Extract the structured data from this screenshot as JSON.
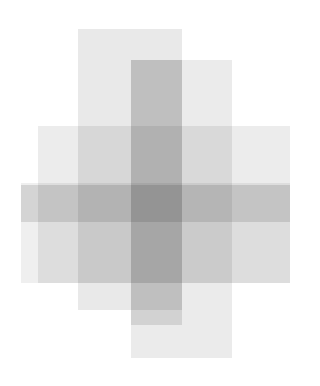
{
  "artwork": {
    "title": "Overlapping Translucent Rectangles",
    "canvas": {
      "width": 320,
      "height": 386,
      "background_color": "#ffffff"
    },
    "blend_mode": "multiply",
    "palette": {
      "lightest": "#ededed",
      "light": "#e8e8e8",
      "mid": "#dedede",
      "dark_overlap": "#cfcfcf",
      "darkest_overlap": "#b9b9b9",
      "background": "#ffffff"
    },
    "shape_count": 6,
    "shapes": [
      {
        "id": "rect-1",
        "label": "vertical-bar-upper-left",
        "orientation": "vertical",
        "x": 78,
        "y": 29,
        "width": 104,
        "height": 281,
        "color": "#e9e9e9",
        "opacity": 1
      },
      {
        "id": "rect-2",
        "label": "vertical-bar-tall-right",
        "orientation": "vertical",
        "x": 131,
        "y": 60,
        "width": 101,
        "height": 298,
        "color": "#ebebeb",
        "opacity": 1
      },
      {
        "id": "rect-3",
        "label": "vertical-bar-center-dark",
        "orientation": "vertical",
        "x": 131,
        "y": 60,
        "width": 51,
        "height": 265,
        "color": "#e4e4e4",
        "opacity": 1
      },
      {
        "id": "rect-4",
        "label": "horizontal-band-upper",
        "orientation": "horizontal",
        "x": 38,
        "y": 126,
        "width": 252,
        "height": 157,
        "color": "#ececec",
        "opacity": 1
      },
      {
        "id": "rect-5",
        "label": "horizontal-band-lower",
        "orientation": "horizontal",
        "x": 21,
        "y": 183,
        "width": 269,
        "height": 100,
        "color": "#efefef",
        "opacity": 1
      },
      {
        "id": "rect-6",
        "label": "horizontal-band-dark-stripe",
        "orientation": "horizontal",
        "x": 21,
        "y": 185,
        "width": 269,
        "height": 37,
        "color": "#e3e3e3",
        "opacity": 1
      }
    ]
  }
}
